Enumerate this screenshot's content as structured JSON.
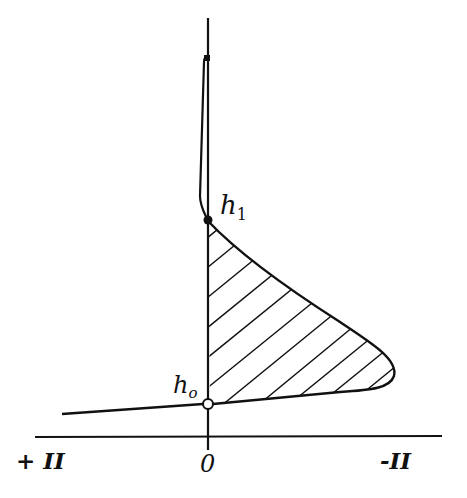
{
  "diagram": {
    "colors": {
      "ink": "#111111",
      "background": "#ffffff"
    },
    "points": {
      "h0": {
        "label": "h",
        "subscript": "o",
        "marker": "open-circle"
      },
      "h1": {
        "label": "h",
        "subscript": "1",
        "marker": "filled-dot"
      }
    },
    "axis": {
      "left_label": "+ II",
      "center_label": "0",
      "right_label": "-II"
    },
    "regions": {
      "shaded": "hatched region bounded by vertical axis between h0 and h1 and the curve"
    }
  }
}
